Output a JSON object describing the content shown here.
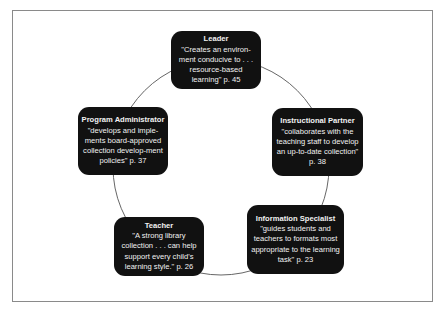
{
  "diagram": {
    "type": "cycle",
    "connector_color": "#555555",
    "box_color": "#111111",
    "text_color": "#f2f2f2",
    "nodes": [
      {
        "id": "leader",
        "title": "Leader",
        "quote": "\"Creates an environ-ment conducive to . . . resource-based learning\" p. 45"
      },
      {
        "id": "instructional-partner",
        "title": "Instructional Partner",
        "quote": "\"collaborates with the teaching staff to develop an up-to-date collection\"  p. 38"
      },
      {
        "id": "information-specialist",
        "title": "Information Specialist",
        "quote": "\"guides students and teachers to formats most appropriate to the learning task\" p. 23"
      },
      {
        "id": "teacher",
        "title": "Teacher",
        "quote": "\"A strong library collection . . . can help support every child's learning style.\" p. 26"
      },
      {
        "id": "program-administrator",
        "title": "Program Administrator",
        "quote": "\"develops and imple-ments board-approved collection develop-ment policies\" p. 37"
      }
    ]
  }
}
